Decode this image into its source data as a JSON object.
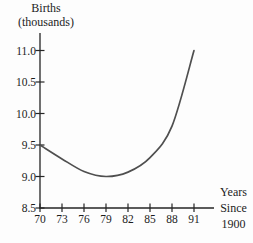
{
  "chart_data": {
    "type": "line",
    "ylabel": "Births (thousands)",
    "ylabel_lines": [
      "Births",
      "(thousands)"
    ],
    "xlabel": "Years Since 1900",
    "xlabel_lines": [
      "Years",
      "Since",
      "1900"
    ],
    "x": [
      70,
      73,
      76,
      79,
      82,
      85,
      88,
      91
    ],
    "y": [
      9.5,
      9.28,
      9.08,
      9.0,
      9.07,
      9.3,
      9.8,
      11.0
    ],
    "x_tick_labels": [
      "70",
      "73",
      "76",
      "79",
      "82",
      "85",
      "88",
      "91"
    ],
    "y_tick_labels": [
      "11.0",
      "10.5",
      "10.0",
      "9.5",
      "9.0",
      "8.5"
    ],
    "xlim": [
      70,
      93.5
    ],
    "ylim": [
      8.5,
      11.3
    ],
    "grid": false,
    "legend": "none",
    "colors": {
      "curve": "#4f4f4f",
      "axis": "#262626",
      "text": "#1c1c1c",
      "background": "#fdfdfd"
    }
  }
}
